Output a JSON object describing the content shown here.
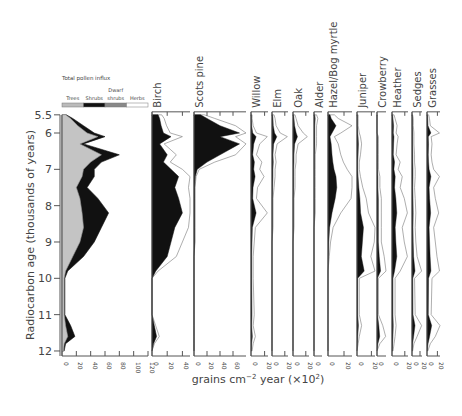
{
  "chart_data": {
    "type": "area",
    "title": "",
    "ylabel": "Radiocarbon age (thousands of years)",
    "xlabel": "grains cm⁻² year (×10²)",
    "ylim": [
      5.5,
      12
    ],
    "yticks": [
      "5.5",
      "6",
      "7",
      "8",
      "9",
      "10",
      "11",
      "12"
    ],
    "influx_panel": {
      "title": "Total pollen influx",
      "legend": [
        {
          "label": "Trees",
          "color": "#bbbbbb"
        },
        {
          "label": "Shrubs",
          "color": "#111111"
        },
        {
          "label": "Dwarf shrubs",
          "color": "#888888"
        },
        {
          "label": "Herbs",
          "color": "#ffffff"
        }
      ],
      "xticks": [
        "0",
        "20",
        "40",
        "60",
        "80",
        "100",
        "120"
      ],
      "depth": [
        5.5,
        5.6,
        5.8,
        6.0,
        6.1,
        6.3,
        6.6,
        6.8,
        7.0,
        7.2,
        7.5,
        7.8,
        8.2,
        8.6,
        9.0,
        9.4,
        9.8,
        10.0,
        11.0,
        11.3,
        11.6,
        11.8,
        12.0
      ],
      "trees": [
        5,
        12,
        22,
        35,
        50,
        25,
        55,
        40,
        30,
        28,
        20,
        25,
        28,
        30,
        25,
        15,
        5,
        3,
        3,
        5,
        8,
        3,
        2
      ],
      "total": [
        6,
        15,
        30,
        45,
        60,
        30,
        80,
        55,
        45,
        45,
        35,
        50,
        65,
        55,
        45,
        30,
        8,
        4,
        4,
        12,
        18,
        5,
        3
      ]
    },
    "taxa": [
      {
        "name": "Birch",
        "xticks": [
          "0",
          "20",
          "40"
        ],
        "max": 50,
        "values": [
          8,
          10,
          12,
          15,
          25,
          10,
          20,
          15,
          25,
          35,
          30,
          35,
          40,
          30,
          25,
          20,
          5,
          0,
          0,
          3,
          6,
          2,
          0
        ]
      },
      {
        "name": "Scots pine",
        "xticks": [
          "0",
          "20",
          "40",
          "60"
        ],
        "max": 80,
        "values": [
          10,
          20,
          40,
          70,
          40,
          70,
          40,
          20,
          5,
          2,
          1,
          1,
          1,
          1,
          1,
          0,
          0,
          0,
          0,
          0,
          0,
          0,
          0
        ]
      },
      {
        "name": "Willow",
        "xticks": [
          "0",
          "20"
        ],
        "max": 25,
        "values": [
          1,
          1,
          2,
          5,
          15,
          8,
          5,
          10,
          8,
          12,
          6,
          5,
          15,
          4,
          3,
          2,
          2,
          2,
          3,
          2,
          4,
          2,
          1
        ]
      },
      {
        "name": "Elm",
        "xticks": [
          "0",
          "20"
        ],
        "max": 25,
        "values": [
          2,
          3,
          4,
          8,
          15,
          5,
          3,
          4,
          3,
          3,
          2,
          1,
          1,
          1,
          0,
          0,
          0,
          0,
          0,
          0,
          0,
          0,
          0
        ]
      },
      {
        "name": "Oak",
        "xticks": [
          "0",
          "20"
        ],
        "max": 25,
        "values": [
          2,
          3,
          5,
          10,
          14,
          5,
          3,
          3,
          2,
          2,
          2,
          1,
          1,
          1,
          0,
          0,
          0,
          0,
          0,
          0,
          0,
          0,
          0
        ]
      },
      {
        "name": "Alder",
        "xticks": [
          "0"
        ],
        "max": 10,
        "values": [
          2,
          3,
          2,
          2,
          2,
          2,
          1,
          1,
          1,
          1,
          1,
          1,
          1,
          0,
          0,
          0,
          0,
          0,
          0,
          0,
          0,
          0,
          0
        ]
      },
      {
        "name": "Hazel/Bog myrtle",
        "xticks": [
          "0",
          "20"
        ],
        "max": 30,
        "values": [
          5,
          8,
          20,
          10,
          5,
          8,
          10,
          12,
          15,
          20,
          22,
          18,
          10,
          4,
          2,
          1,
          0,
          0,
          0,
          0,
          0,
          0,
          0
        ]
      },
      {
        "name": "Juniper",
        "xticks": [
          "0",
          "20"
        ],
        "max": 25,
        "values": [
          1,
          1,
          1,
          2,
          3,
          4,
          3,
          2,
          2,
          3,
          5,
          8,
          10,
          18,
          15,
          12,
          20,
          2,
          2,
          4,
          2,
          1,
          0
        ]
      },
      {
        "name": "Crowberry",
        "xticks": [
          "0"
        ],
        "max": 10,
        "values": [
          0,
          0,
          0,
          0,
          1,
          1,
          1,
          1,
          1,
          2,
          2,
          3,
          3,
          3,
          3,
          5,
          8,
          1,
          1,
          4,
          6,
          2,
          0
        ]
      },
      {
        "name": "Heather",
        "xticks": [
          "0",
          "20"
        ],
        "max": 25,
        "values": [
          2,
          3,
          5,
          4,
          6,
          5,
          4,
          8,
          6,
          10,
          8,
          12,
          15,
          10,
          12,
          15,
          8,
          3,
          3,
          4,
          3,
          2,
          1
        ]
      },
      {
        "name": "Sedges",
        "xticks": [
          "0",
          "20"
        ],
        "max": 25,
        "values": [
          1,
          2,
          2,
          3,
          3,
          3,
          4,
          4,
          5,
          5,
          4,
          5,
          6,
          5,
          6,
          8,
          15,
          4,
          5,
          15,
          8,
          3,
          1
        ]
      },
      {
        "name": "Grasses",
        "xticks": [
          "0",
          "20"
        ],
        "max": 25,
        "values": [
          2,
          3,
          4,
          15,
          5,
          6,
          5,
          6,
          8,
          15,
          8,
          10,
          14,
          8,
          10,
          12,
          15,
          6,
          5,
          18,
          10,
          4,
          1
        ]
      }
    ]
  },
  "labels": {
    "ylabel": "Radiocarbon age (thousands of years)",
    "xlabel_main": "grains cm",
    "xlabel_sup": "−2",
    "xlabel_rest": " year (×10",
    "xlabel_sup2": "2",
    "xlabel_end": ")"
  }
}
